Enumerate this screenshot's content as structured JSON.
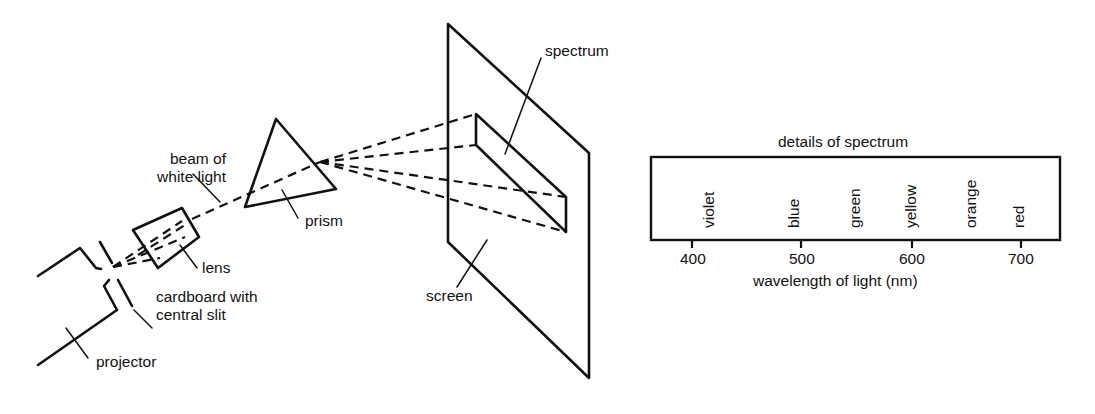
{
  "diagram": {
    "labels": {
      "beam": [
        "beam of",
        "white light"
      ],
      "lens": "lens",
      "cardboard": [
        "cardboard with",
        "central slit"
      ],
      "projector": "projector",
      "prism": "prism",
      "screen": "screen",
      "spectrum": "spectrum"
    },
    "spectrum_details": {
      "title": "details of spectrum",
      "colors": [
        "violet",
        "blue",
        "green",
        "yellow",
        "orange",
        "red"
      ],
      "axis_ticks": [
        "400",
        "500",
        "600",
        "700"
      ],
      "axis_label": "wavelength of light (nm)"
    }
  }
}
